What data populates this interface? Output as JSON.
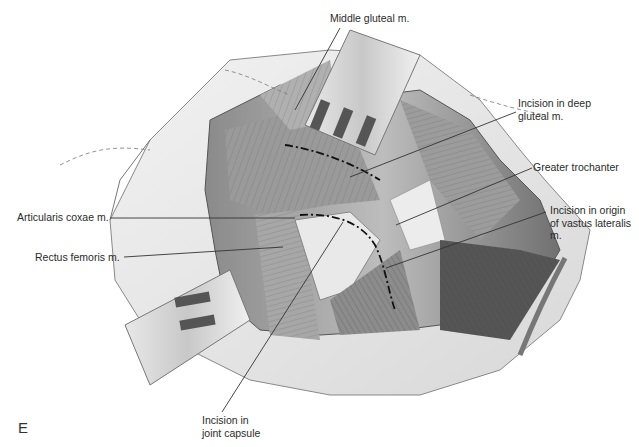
{
  "figure": {
    "panel_letter": "E",
    "labels": {
      "middle_gluteal": "Middle gluteal m.",
      "incision_deep_gluteal": "Incision in deep\ngluteal m.",
      "greater_trochanter": "Greater trochanter",
      "incision_vastus": "Incision in origin\nof vastus lateralis\nm.",
      "articularis_coxae": "Articularis coxae m.",
      "rectus_femoris": "Rectus femoris m.",
      "incision_joint_capsule": "Incision in\njoint capsule"
    }
  }
}
